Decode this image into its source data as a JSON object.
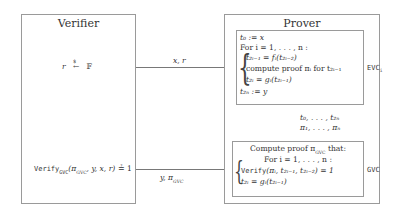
{
  "verifier": {
    "title": "Verifier",
    "sample": {
      "lhs": "r",
      "arrow_label": "$",
      "rhs": "𝔽"
    },
    "verify_check": {
      "fn": "Verify",
      "sub": "GVC",
      "args": "(π",
      "args_sub": "GVC",
      "args_rest": ", y, x, r)",
      "eq": "≟ 1"
    }
  },
  "prover": {
    "title": "Prover",
    "evc": {
      "label": "EVC",
      "label_sub": "i",
      "lines": [
        "t₀ := x",
        "For i = 1, . . . , n :",
        "t₂ᵢ₋₁ = fᵢ(t₂ᵢ₋₂)",
        "compute proof πᵢ for t₂ᵢ₋₁",
        "t₂ᵢ = gᵢ(t₂ᵢ₋₁)",
        "t₂ₙ := y"
      ]
    },
    "gvc": {
      "label": "GVC",
      "lines": [
        "Compute proof π",
        "GVC",
        " that:",
        "For i = 1, . . . , n :",
        "Verify",
        "(πᵢ, t₂ᵢ₋₁, t₂ᵢ₋₂) = 1",
        "t₂ᵢ = gᵢ(t₂ᵢ₋₁)"
      ]
    }
  },
  "arrows": {
    "to_prover": "x, r",
    "evc_to_gvc_line1": "t₀, . . . , t₂ₙ",
    "evc_to_gvc_line2": "π₁, . . . , πₙ",
    "to_verifier": {
      "text": "y, π",
      "sub": "GVC"
    }
  }
}
